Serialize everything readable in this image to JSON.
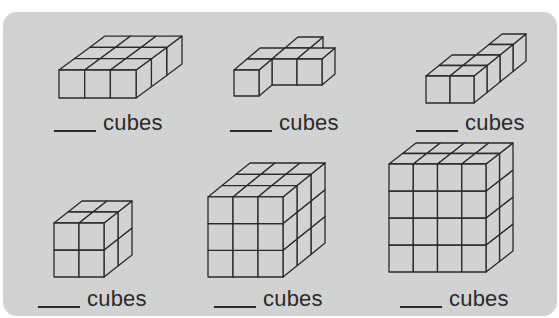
{
  "worksheet": {
    "panel_color": "#d2d2d2",
    "line_color": "#2a2a2a",
    "items": [
      {
        "label": "cubes",
        "answer_blank": "____",
        "label_pos": [
          54,
          108
        ],
        "figure": {
          "type": "box",
          "cols": 3,
          "rows": 1,
          "depth": 3,
          "origin": [
            59,
            98
          ],
          "w": 25.7,
          "h": 28,
          "dx": 15.3,
          "dy": -11.3
        }
      },
      {
        "label": "cubes",
        "answer_blank": "____",
        "label_pos": [
          230,
          108
        ],
        "figure": {
          "type": "cubes",
          "origin": [
            234,
            96
          ],
          "w": 25,
          "h": 26,
          "dx": 13,
          "dy": -11,
          "cubes": [
            [
              0,
              0,
              0
            ],
            [
              0,
              0,
              1
            ],
            [
              1,
              0,
              1
            ],
            [
              2,
              0,
              1
            ],
            [
              1,
              0,
              2
            ]
          ]
        }
      },
      {
        "label": "cubes",
        "answer_blank": "____",
        "label_pos": [
          416,
          108
        ],
        "figure": {
          "type": "cubes",
          "origin": [
            426,
            103
          ],
          "w": 24,
          "h": 27,
          "dx": 13,
          "dy": -10.5,
          "cubes": [
            [
              0,
              0,
              0
            ],
            [
              1,
              0,
              0
            ],
            [
              0,
              0,
              1
            ],
            [
              1,
              0,
              1
            ],
            [
              1,
              0,
              2
            ],
            [
              1,
              0,
              3
            ]
          ]
        }
      },
      {
        "label": "cubes",
        "answer_blank": "____",
        "label_pos": [
          38,
          284
        ],
        "figure": {
          "type": "box",
          "cols": 2,
          "rows": 2,
          "depth": 2,
          "origin": [
            54,
            277
          ],
          "w": 25,
          "h": 27,
          "dx": 14,
          "dy": -11
        }
      },
      {
        "label": "cubes",
        "answer_blank": "____",
        "label_pos": [
          214,
          284
        ],
        "figure": {
          "type": "box",
          "cols": 3,
          "rows": 3,
          "depth": 3,
          "origin": [
            208,
            277
          ],
          "w": 25,
          "h": 26.7,
          "dx": 14,
          "dy": -11.3
        }
      },
      {
        "label": "cubes",
        "answer_blank": "____",
        "label_pos": [
          400,
          284
        ],
        "figure": {
          "type": "box",
          "cols": 4,
          "rows": 4,
          "depth": 2,
          "origin": [
            389,
            272
          ],
          "w": 24.25,
          "h": 27,
          "dx": 13.5,
          "dy": -10.5
        }
      }
    ]
  }
}
